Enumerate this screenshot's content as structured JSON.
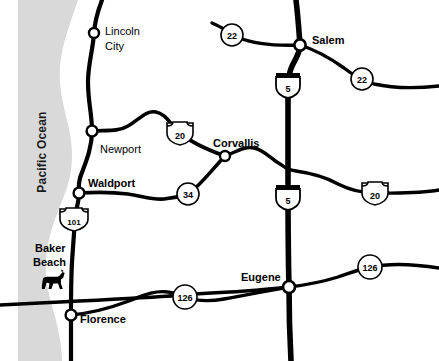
{
  "map": {
    "title": "Oregon Coast and Willamette Valley Road Map",
    "width": 439,
    "height": 361,
    "colors": {
      "ocean_fill": "#d9d9d9",
      "road": "#000000",
      "background": "#ffffff",
      "shield_fill": "#ffffff",
      "city_node_fill": "#ffffff"
    },
    "water": {
      "name": "Pacific Ocean",
      "label": "Pacific Ocean",
      "orientation": "vertical-bottom-to-top"
    },
    "cities": [
      {
        "name": "Lincoln City",
        "label_line1": "Lincoln",
        "label_line2": "City",
        "x": 94,
        "y": 33,
        "label_x": 105,
        "label_y": 30,
        "bold": false
      },
      {
        "name": "Newport",
        "label_line1": "Newport",
        "label_line2": "",
        "x": 92,
        "y": 131,
        "label_x": 100,
        "label_y": 153,
        "bold": false
      },
      {
        "name": "Waldport",
        "label_line1": "Waldport",
        "label_line2": "",
        "x": 79,
        "y": 193,
        "label_x": 88,
        "label_y": 187,
        "bold": true
      },
      {
        "name": "Florence",
        "label_line1": "Florence",
        "label_line2": "",
        "x": 71,
        "y": 315,
        "label_x": 80,
        "label_y": 322,
        "bold": true
      },
      {
        "name": "Corvallis",
        "label_line1": "Corvallis",
        "label_line2": "",
        "x": 225,
        "y": 156,
        "label_x": 214,
        "label_y": 147,
        "bold": true
      },
      {
        "name": "Salem",
        "label_line1": "Salem",
        "label_line2": "",
        "x": 300,
        "y": 45,
        "label_x": 312,
        "label_y": 44,
        "bold": true
      },
      {
        "name": "Eugene",
        "label_line1": "Eugene",
        "label_line2": "",
        "x": 289,
        "y": 287,
        "label_x": 285,
        "label_y": 281,
        "bold": true
      }
    ],
    "landmarks": [
      {
        "name": "Baker Beach",
        "label_line1": "Baker",
        "label_line2": "Beach",
        "label_x": 35,
        "label_y": 252,
        "icon": "horse-icon",
        "icon_x": 38,
        "icon_y": 277
      }
    ],
    "route_markers": [
      {
        "id": "us-101",
        "number": "101",
        "type": "us-shield",
        "x": 74,
        "y": 219
      },
      {
        "id": "us-20-coast",
        "number": "20",
        "type": "us-shield",
        "x": 180,
        "y": 133
      },
      {
        "id": "or-34",
        "number": "34",
        "type": "circle",
        "x": 188,
        "y": 194
      },
      {
        "id": "i-5-north",
        "number": "5",
        "type": "interstate-shield",
        "x": 288,
        "y": 85
      },
      {
        "id": "i-5-south",
        "number": "5",
        "type": "interstate-shield",
        "x": 288,
        "y": 197
      },
      {
        "id": "or-22-west",
        "number": "22",
        "type": "circle",
        "x": 232,
        "y": 35
      },
      {
        "id": "or-22-east",
        "number": "22",
        "type": "circle",
        "x": 362,
        "y": 79
      },
      {
        "id": "us-20-east",
        "number": "20",
        "type": "us-shield",
        "x": 375,
        "y": 193
      },
      {
        "id": "or-126-west",
        "number": "126",
        "type": "circle",
        "x": 185,
        "y": 297
      },
      {
        "id": "or-126-east",
        "number": "126",
        "type": "circle",
        "x": 370,
        "y": 267
      }
    ],
    "highways": [
      {
        "name": "US 101 coastal highway",
        "id": "us101"
      },
      {
        "name": "US 20 Newport to Corvallis",
        "id": "us20"
      },
      {
        "name": "Oregon 34 Waldport to Corvallis",
        "id": "or34"
      },
      {
        "name": "Interstate 5",
        "id": "i5"
      },
      {
        "name": "Oregon 22 Salem",
        "id": "or22"
      },
      {
        "name": "Oregon 126 Florence to Eugene",
        "id": "or126"
      },
      {
        "name": "US 20 east of Corvallis",
        "id": "us20east"
      }
    ]
  }
}
